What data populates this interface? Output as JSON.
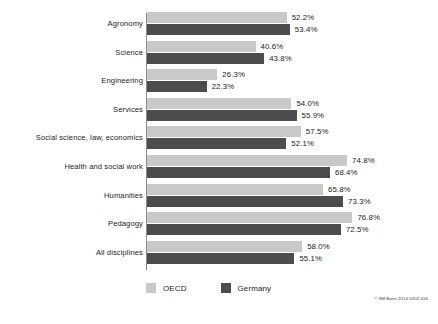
{
  "chart_data": {
    "type": "bar",
    "orientation": "horizontal",
    "title": "",
    "subtitle": "",
    "xlabel": "",
    "ylabel": "",
    "xlim": [
      0,
      80
    ],
    "grid": false,
    "legend_position": "bottom-left",
    "value_suffix": "%",
    "categories": [
      "Agronomy",
      "Science",
      "Engineering",
      "Services",
      "Social science, law, economics",
      "Health and social work",
      "Humanities",
      "Pedagogy",
      "All disciplines"
    ],
    "series": [
      {
        "name": "OECD",
        "color": "#c9c9c9",
        "values": [
          52.2,
          40.6,
          26.3,
          54.0,
          57.5,
          74.8,
          65.8,
          76.8,
          58.0
        ],
        "labels": [
          "52.2%",
          "40.6%",
          "26.3%",
          "54.0%",
          "57.5%",
          "74.8%",
          "65.8%",
          "76.8%",
          "58.0%"
        ]
      },
      {
        "name": "Germany",
        "color": "#4d4d4d",
        "values": [
          53.4,
          43.8,
          22.3,
          55.9,
          52.1,
          68.4,
          73.3,
          72.5,
          55.1
        ],
        "labels": [
          "53.4%",
          "43.8%",
          "22.3%",
          "55.9%",
          "52.1%",
          "68.4%",
          "73.3%",
          "72.5%",
          "55.1%"
        ]
      }
    ]
  },
  "legend": {
    "items": [
      {
        "label": "OECD",
        "color": "#c9c9c9"
      },
      {
        "label": "Germany",
        "color": "#4d4d4d"
      }
    ]
  },
  "credit": "© IfM Bonn 2014 0202 016"
}
